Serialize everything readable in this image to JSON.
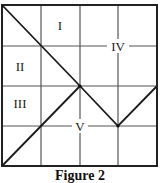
{
  "figure": {
    "caption": "Figure 2",
    "grid": {
      "rows": 4,
      "cols": 4,
      "left": 2,
      "top": 5,
      "right": 157,
      "bottom": 166,
      "border_color": "#222222",
      "grid_color": "#555555"
    },
    "regions": [
      {
        "id": "I",
        "label": "I"
      },
      {
        "id": "II",
        "label": "II"
      },
      {
        "id": "III",
        "label": "III"
      },
      {
        "id": "IV",
        "label": "IV"
      },
      {
        "id": "V",
        "label": "V"
      }
    ],
    "diagonal_paths": [
      {
        "name": "descending-zigzag",
        "points": [
          [
            2,
            5
          ],
          [
            80,
            86
          ],
          [
            118,
            126
          ],
          [
            157,
            86
          ]
        ]
      },
      {
        "name": "ascending-diagonal",
        "points": [
          [
            2,
            166
          ],
          [
            80,
            86
          ]
        ]
      }
    ]
  }
}
